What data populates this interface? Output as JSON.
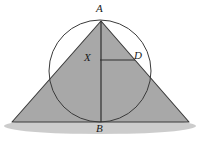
{
  "figure": {
    "background_color": "#ffffff",
    "labels": [
      {
        "id": "A",
        "text": "A",
        "x": 96,
        "y": 3,
        "role": "apex-vertex"
      },
      {
        "id": "X",
        "text": "X",
        "x": 84,
        "y": 52,
        "role": "interior-point"
      },
      {
        "id": "D",
        "text": "D",
        "x": 134,
        "y": 50,
        "role": "point-on-side"
      },
      {
        "id": "B",
        "text": "B",
        "x": 96,
        "y": 123,
        "role": "base-midpoint-vertex"
      }
    ],
    "colors": {
      "triangle_fill": "#a8a8a8",
      "triangle_stroke": "#3a3a3a",
      "circle_stroke": "#3a3a3a",
      "segment_stroke": "#2e2e2e",
      "shadow_fill": "#c9c9c9",
      "label_color": "#1a1a1a",
      "background": "#ffffff"
    },
    "geometry": {
      "apex_A": {
        "x": 101,
        "y": 21
      },
      "base_left": {
        "x": 12,
        "y": 122
      },
      "base_right": {
        "x": 189,
        "y": 122
      },
      "base_midpoint_B": {
        "x": 101,
        "y": 122
      },
      "circle": {
        "cx": 100,
        "cy": 71,
        "r": 51
      },
      "point_X": {
        "x": 100,
        "y": 60
      },
      "point_D": {
        "x": 135,
        "y": 60
      },
      "segment_AB": {
        "x1": 101,
        "y1": 21,
        "x2": 101,
        "y2": 122
      },
      "segment_XD": {
        "x1": 100,
        "y1": 60,
        "x2": 135,
        "y2": 60
      },
      "shadow_ellipse": {
        "cx": 100,
        "cy": 126,
        "rx": 96,
        "ry": 8
      }
    },
    "stroke_widths": {
      "triangle": 1.1,
      "circle": 1.0,
      "segment": 1.2
    }
  }
}
